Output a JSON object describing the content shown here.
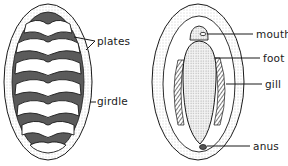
{
  "diagram": {
    "views": [
      {
        "name": "dorsal",
        "labels": [
          {
            "id": "plates",
            "text": "plates",
            "x": 97,
            "y": 36
          },
          {
            "id": "girdle",
            "text": "girdle",
            "x": 97,
            "y": 96
          }
        ]
      },
      {
        "name": "ventral",
        "labels": [
          {
            "id": "mouth",
            "text": "mouth",
            "x": 256,
            "y": 29
          },
          {
            "id": "foot",
            "text": "foot",
            "x": 263,
            "y": 53
          },
          {
            "id": "gill",
            "text": "gill",
            "x": 265,
            "y": 79
          },
          {
            "id": "anus",
            "text": "anus",
            "x": 253,
            "y": 141
          }
        ]
      }
    ]
  },
  "colors": {
    "ink": "#1a1a1a",
    "shade": "#555555",
    "paper": "#ffffff",
    "stipple": "#cfcfcf"
  }
}
